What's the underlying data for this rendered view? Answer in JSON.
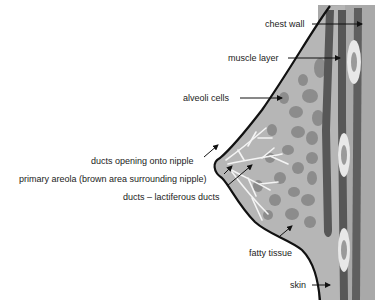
{
  "diagram": {
    "labels": {
      "chest_wall": "chest wall",
      "muscle_layer": "muscle layer",
      "alveoli_cells": "alveoli cells",
      "ducts_opening": "ducts opening onto nipple",
      "primary_areola": "primary areola (brown area surrounding nipple)",
      "ducts_lactiferous": "ducts – lactiferous ducts",
      "fatty_tissue": "fatty tissue",
      "skin": "skin"
    },
    "colors": {
      "background": "#ffffff",
      "tissue": "#b4b4b4",
      "lobules": "#8e8e8e",
      "muscle_band": "#565656",
      "chest_wall": "#a8a8a8",
      "ducts": "#f4f4f4",
      "outline": "#111111",
      "text": "#222222"
    }
  }
}
